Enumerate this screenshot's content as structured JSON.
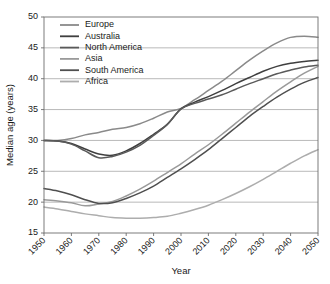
{
  "chart_data": {
    "type": "line",
    "title": "",
    "xlabel": "Year",
    "ylabel": "Median age (years)",
    "xlim": [
      1950,
      2050
    ],
    "ylim": [
      15,
      50
    ],
    "ytick_values": [
      15,
      20,
      25,
      30,
      35,
      40,
      45,
      50
    ],
    "ytick_labels": [
      "15",
      "20",
      "25",
      "30",
      "35",
      "40",
      "45",
      "50"
    ],
    "xtick_values": [
      1950,
      1960,
      1970,
      1980,
      1990,
      2000,
      2010,
      2020,
      2030,
      2040,
      2050
    ],
    "xtick_labels": [
      "1950",
      "1960",
      "1970",
      "1980",
      "1990",
      "2000",
      "2010",
      "2020",
      "2030",
      "2040",
      "2050"
    ],
    "grid": "horizontal",
    "legend_position": "upper-left",
    "x": [
      1950,
      1955,
      1960,
      1965,
      1970,
      1975,
      1980,
      1985,
      1990,
      1995,
      2000,
      2005,
      2010,
      2015,
      2020,
      2025,
      2030,
      2035,
      2040,
      2045,
      2050
    ],
    "series": [
      {
        "name": "Europe",
        "color": "#8a8a8a",
        "values": [
          30.0,
          30.0,
          30.3,
          30.9,
          31.3,
          31.8,
          32.1,
          32.7,
          33.6,
          34.6,
          35.2,
          36.6,
          38.1,
          39.6,
          41.3,
          43.0,
          44.5,
          45.8,
          46.7,
          46.9,
          46.7
        ]
      },
      {
        "name": "Australia",
        "color": "#3f3f3f",
        "values": [
          30.0,
          29.9,
          29.5,
          28.6,
          27.8,
          27.6,
          28.3,
          29.5,
          31.0,
          32.6,
          35.1,
          36.2,
          37.1,
          38.1,
          39.2,
          40.2,
          41.2,
          42.0,
          42.5,
          42.8,
          43.0
        ]
      },
      {
        "name": "North America",
        "color": "#5a5a5a",
        "values": [
          30.0,
          29.9,
          29.4,
          28.3,
          27.2,
          27.4,
          28.1,
          29.2,
          30.8,
          32.6,
          35.1,
          36.0,
          36.7,
          37.4,
          38.3,
          39.2,
          40.0,
          40.8,
          41.4,
          41.9,
          42.2
        ]
      },
      {
        "name": "Asia",
        "color": "#9a9a9a",
        "values": [
          20.4,
          20.2,
          19.9,
          19.4,
          19.7,
          20.1,
          21.0,
          22.1,
          23.4,
          24.8,
          26.2,
          27.8,
          29.3,
          31.0,
          32.8,
          34.6,
          36.3,
          38.0,
          39.5,
          40.9,
          42.0
        ]
      },
      {
        "name": "South America",
        "color": "#4f4f4f",
        "values": [
          22.2,
          21.8,
          21.2,
          20.4,
          19.8,
          19.9,
          20.6,
          21.5,
          22.6,
          24.0,
          25.4,
          26.9,
          28.5,
          30.3,
          32.1,
          33.9,
          35.5,
          37.0,
          38.3,
          39.4,
          40.2
        ]
      },
      {
        "name": "Africa",
        "color": "#adadad",
        "values": [
          19.2,
          18.9,
          18.5,
          18.1,
          17.8,
          17.5,
          17.4,
          17.4,
          17.5,
          17.7,
          18.2,
          18.8,
          19.5,
          20.4,
          21.4,
          22.5,
          23.7,
          25.0,
          26.3,
          27.5,
          28.5
        ]
      }
    ]
  },
  "legend": {
    "items": [
      {
        "label": "Europe"
      },
      {
        "label": "Australia"
      },
      {
        "label": "North America"
      },
      {
        "label": "Asia"
      },
      {
        "label": "South America"
      },
      {
        "label": "Africa"
      }
    ]
  }
}
